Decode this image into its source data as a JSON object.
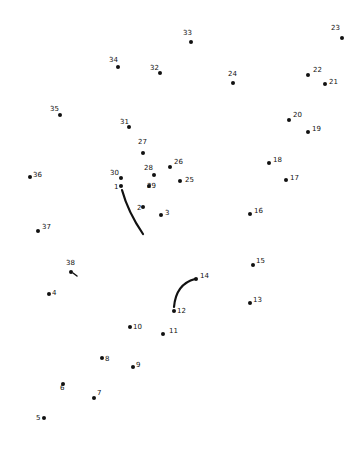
{
  "puzzle": {
    "type": "connect-the-dots",
    "ink_color": "#111111",
    "background": "#ffffff",
    "dots": [
      {
        "n": "1",
        "x": 121,
        "y": 186,
        "lx": 114,
        "ly": 188
      },
      {
        "n": "2",
        "x": 143,
        "y": 207,
        "lx": 137,
        "ly": 209
      },
      {
        "n": "3",
        "x": 161,
        "y": 215,
        "lx": 165,
        "ly": 214
      },
      {
        "n": "4",
        "x": 49,
        "y": 294,
        "lx": 52,
        "ly": 294
      },
      {
        "n": "5",
        "x": 44,
        "y": 418,
        "lx": 36,
        "ly": 419
      },
      {
        "n": "6",
        "x": 63,
        "y": 384,
        "lx": 60,
        "ly": 389
      },
      {
        "n": "7",
        "x": 94,
        "y": 398,
        "lx": 97,
        "ly": 394
      },
      {
        "n": "8",
        "x": 102,
        "y": 358,
        "lx": 105,
        "ly": 360
      },
      {
        "n": "9",
        "x": 133,
        "y": 367,
        "lx": 136,
        "ly": 366
      },
      {
        "n": "10",
        "x": 130,
        "y": 327,
        "lx": 133,
        "ly": 328
      },
      {
        "n": "11",
        "x": 163,
        "y": 334,
        "lx": 169,
        "ly": 332
      },
      {
        "n": "12",
        "x": 174,
        "y": 311,
        "lx": 177,
        "ly": 312
      },
      {
        "n": "13",
        "x": 250,
        "y": 303,
        "lx": 253,
        "ly": 301
      },
      {
        "n": "14",
        "x": 196,
        "y": 279,
        "lx": 200,
        "ly": 277
      },
      {
        "n": "15",
        "x": 253,
        "y": 265,
        "lx": 256,
        "ly": 262
      },
      {
        "n": "16",
        "x": 250,
        "y": 214,
        "lx": 254,
        "ly": 212
      },
      {
        "n": "17",
        "x": 286,
        "y": 180,
        "lx": 290,
        "ly": 179
      },
      {
        "n": "18",
        "x": 269,
        "y": 163,
        "lx": 273,
        "ly": 161
      },
      {
        "n": "19",
        "x": 308,
        "y": 132,
        "lx": 312,
        "ly": 130
      },
      {
        "n": "20",
        "x": 289,
        "y": 120,
        "lx": 293,
        "ly": 116
      },
      {
        "n": "21",
        "x": 325,
        "y": 84,
        "lx": 329,
        "ly": 83
      },
      {
        "n": "22",
        "x": 308,
        "y": 75,
        "lx": 313,
        "ly": 71
      },
      {
        "n": "23",
        "x": 342,
        "y": 38,
        "lx": 331,
        "ly": 29
      },
      {
        "n": "24",
        "x": 233,
        "y": 83,
        "lx": 228,
        "ly": 75
      },
      {
        "n": "25",
        "x": 180,
        "y": 181,
        "lx": 185,
        "ly": 181
      },
      {
        "n": "26",
        "x": 170,
        "y": 167,
        "lx": 174,
        "ly": 163
      },
      {
        "n": "27",
        "x": 143,
        "y": 153,
        "lx": 138,
        "ly": 143
      },
      {
        "n": "28",
        "x": 154,
        "y": 175,
        "lx": 144,
        "ly": 169
      },
      {
        "n": "29",
        "x": 149,
        "y": 186,
        "lx": 147,
        "ly": 187
      },
      {
        "n": "30",
        "x": 121,
        "y": 178,
        "lx": 110,
        "ly": 174
      },
      {
        "n": "31",
        "x": 129,
        "y": 127,
        "lx": 120,
        "ly": 123
      },
      {
        "n": "32",
        "x": 160,
        "y": 73,
        "lx": 150,
        "ly": 69
      },
      {
        "n": "33",
        "x": 191,
        "y": 42,
        "lx": 183,
        "ly": 34
      },
      {
        "n": "34",
        "x": 118,
        "y": 67,
        "lx": 109,
        "ly": 61
      },
      {
        "n": "35",
        "x": 60,
        "y": 115,
        "lx": 50,
        "ly": 110
      },
      {
        "n": "36",
        "x": 30,
        "y": 177,
        "lx": 33,
        "ly": 176
      },
      {
        "n": "37",
        "x": 38,
        "y": 231,
        "lx": 42,
        "ly": 228
      },
      {
        "n": "38",
        "x": 71,
        "y": 272,
        "lx": 66,
        "ly": 264
      }
    ],
    "strokes": [
      {
        "name": "stroke-1-curve",
        "d": "M122,190 Q128,212 143,234"
      },
      {
        "name": "stroke-12-14-curve",
        "d": "M174,307 Q176,284 195,279"
      },
      {
        "name": "stroke-38-tick",
        "d": "M73,273 L77,276"
      }
    ]
  }
}
